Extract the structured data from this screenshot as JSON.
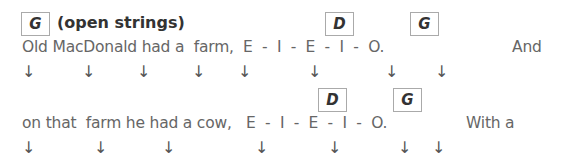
{
  "lines": [
    {
      "chords": [
        {
          "label": "G",
          "x": 21,
          "y": 12
        },
        {
          "label": "D",
          "x": 325,
          "y": 12
        },
        {
          "label": "G",
          "x": 410,
          "y": 12
        }
      ],
      "chord_note": "(open strings)",
      "lyrics": [
        {
          "text": "Old MacDonald had a  farm,",
          "x": 22
        },
        {
          "text": "E  -  I  -  E  -  I  -  O.",
          "x": 243
        },
        {
          "text": "And",
          "x": 512
        }
      ],
      "lyric_y": 38,
      "arrow_y": 64,
      "strum_arrows_x": [
        22,
        82,
        137,
        192,
        238,
        308,
        385,
        435
      ]
    },
    {
      "chords": [
        {
          "label": "D",
          "x": 318,
          "y": 88
        },
        {
          "label": "G",
          "x": 393,
          "y": 88
        }
      ],
      "lyrics": [
        {
          "text": "on that  farm he had a cow,",
          "x": 22
        },
        {
          "text": "E  -  I  -  E  -  I  -  O.",
          "x": 246
        },
        {
          "text": "With a",
          "x": 466
        }
      ],
      "lyric_y": 114,
      "arrow_y": 140,
      "strum_arrows_x": [
        22,
        94,
        162,
        255,
        328,
        398,
        432
      ]
    }
  ],
  "strum_symbol": "↓"
}
